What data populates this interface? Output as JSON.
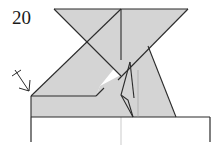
{
  "diagram": {
    "step_number": "20",
    "type": "origami-folding-step",
    "colors": {
      "paper_fill": "#d4d4d4",
      "line": "#2b2b2b",
      "faint_line": "#9a9a9a",
      "background": "#ffffff"
    },
    "symbols": [
      {
        "name": "fold-arrow",
        "description": "arrow with crossed tail pointing to lower-left corner of flap"
      }
    ]
  }
}
